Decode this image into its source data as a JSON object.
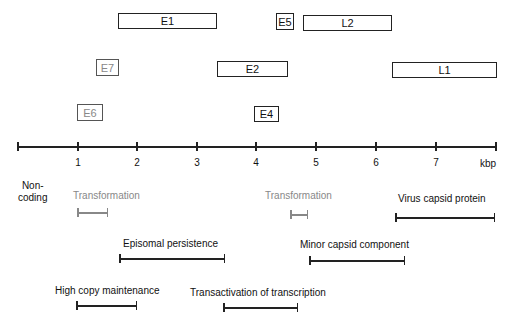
{
  "genes": [
    {
      "id": "e1",
      "label": "E1",
      "x": 118,
      "y": 13,
      "w": 99,
      "h": 16,
      "style": "black"
    },
    {
      "id": "e5",
      "label": "E5",
      "x": 276,
      "y": 13,
      "w": 18,
      "h": 17,
      "style": "black"
    },
    {
      "id": "l2",
      "label": "L2",
      "x": 303,
      "y": 15,
      "w": 89,
      "h": 16,
      "style": "black"
    },
    {
      "id": "e7",
      "label": "E7",
      "x": 96,
      "y": 59,
      "w": 23,
      "h": 17,
      "style": "gray"
    },
    {
      "id": "e2",
      "label": "E2",
      "x": 217,
      "y": 61,
      "w": 71,
      "h": 16,
      "style": "black"
    },
    {
      "id": "l1",
      "label": "L1",
      "x": 392,
      "y": 62,
      "w": 105,
      "h": 16,
      "style": "black"
    },
    {
      "id": "e6",
      "label": "E6",
      "x": 77,
      "y": 104,
      "w": 26,
      "h": 17,
      "style": "gray"
    },
    {
      "id": "e4",
      "label": "E4",
      "x": 254,
      "y": 106,
      "w": 25,
      "h": 16,
      "style": "black"
    }
  ],
  "axis": {
    "unit": "kbp",
    "ticks": [
      {
        "label": "",
        "x": 17
      },
      {
        "label": "1",
        "x": 77
      },
      {
        "label": "2",
        "x": 136
      },
      {
        "label": "3",
        "x": 196
      },
      {
        "label": "4",
        "x": 255
      },
      {
        "label": "5",
        "x": 315
      },
      {
        "label": "6",
        "x": 375
      },
      {
        "label": "7",
        "x": 435
      },
      {
        "label": "",
        "x": 495
      }
    ]
  },
  "noncoding": "Non-\ncoding",
  "functions": [
    {
      "label": "Transformation",
      "tx": 73,
      "ty": 190,
      "x1": 77,
      "x2": 108,
      "by": 212,
      "style": "gray"
    },
    {
      "label": "Transformation",
      "tx": 265,
      "ty": 190,
      "x1": 290,
      "x2": 308,
      "by": 214,
      "style": "gray"
    },
    {
      "label": "Virus capsid protein",
      "tx": 398,
      "ty": 193,
      "x1": 395,
      "x2": 495,
      "by": 217,
      "style": "black"
    },
    {
      "label": "Episomal persistence",
      "tx": 123,
      "ty": 238,
      "x1": 119,
      "x2": 225,
      "by": 258,
      "style": "black"
    },
    {
      "label": "Minor capsid component",
      "tx": 300,
      "ty": 239,
      "x1": 309,
      "x2": 405,
      "by": 260,
      "style": "black"
    },
    {
      "label": "High copy maintenance",
      "tx": 55,
      "ty": 285,
      "x1": 76,
      "x2": 137,
      "by": 305,
      "style": "black"
    },
    {
      "label": "Transactivation of transcription",
      "tx": 190,
      "ty": 287,
      "x1": 223,
      "x2": 298,
      "by": 307,
      "style": "black"
    }
  ]
}
